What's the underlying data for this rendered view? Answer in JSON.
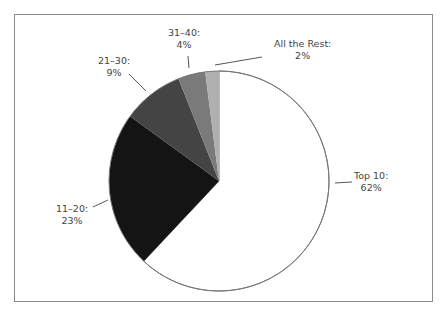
{
  "chart_data": {
    "type": "pie",
    "title": "",
    "categories": [
      "Top 10",
      "11–20",
      "21–30",
      "31–40",
      "All the Rest"
    ],
    "values": [
      62,
      23,
      9,
      4,
      2
    ],
    "unit": "%",
    "colors": [
      "#ffffff",
      "#141414",
      "#444444",
      "#7a7a7a",
      "#b0b0b0"
    ],
    "start_angle_deg": 0,
    "direction": "clockwise",
    "legend": "none (direct labels with leader lines)"
  },
  "labels": {
    "top10": {
      "name": "Top 10:",
      "value": "62%"
    },
    "r11_20": {
      "name": "11–20:",
      "value": "23%"
    },
    "r21_30": {
      "name": "21–30:",
      "value": "9%"
    },
    "r31_40": {
      "name": "31–40:",
      "value": "4%"
    },
    "rest": {
      "name": "All the Rest:",
      "value": "2%"
    }
  }
}
